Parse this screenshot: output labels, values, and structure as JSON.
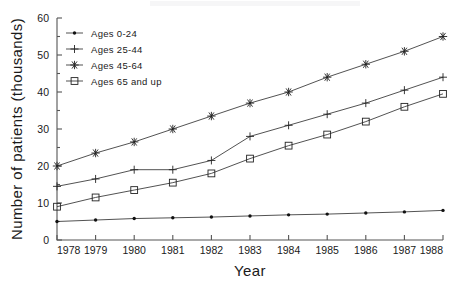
{
  "chart_data": {
    "type": "line",
    "title": "",
    "xlabel": "Year",
    "ylabel": "Number of patients (thousands)",
    "x": [
      1978,
      1979,
      1980,
      1981,
      1982,
      1983,
      1984,
      1985,
      1986,
      1987,
      1988
    ],
    "categories": [
      "1978",
      "1979",
      "1980",
      "1981",
      "1982",
      "1983",
      "1984",
      "1985",
      "1986",
      "1987",
      "1988"
    ],
    "xlim": [
      1978,
      1988
    ],
    "ylim": [
      0,
      60
    ],
    "yticks": [
      0,
      10,
      20,
      30,
      40,
      50,
      60
    ],
    "ytick_labels": [
      "0",
      "10",
      "20",
      "30",
      "40",
      "50",
      "60"
    ],
    "grid": false,
    "legend_position": "upper left inside",
    "series": [
      {
        "name": "Ages 0-24",
        "marker": "filled-dot",
        "values": [
          5.0,
          5.4,
          5.8,
          6.0,
          6.2,
          6.5,
          6.8,
          7.0,
          7.3,
          7.6,
          8.0
        ]
      },
      {
        "name": "Ages 25-44",
        "marker": "plus",
        "values": [
          14.5,
          16.5,
          19.0,
          19.0,
          21.5,
          28.0,
          31.0,
          34.0,
          37.0,
          40.5,
          44.0
        ]
      },
      {
        "name": "Ages 45-64",
        "marker": "asterisk",
        "values": [
          20.0,
          23.5,
          26.5,
          30.0,
          33.5,
          37.0,
          40.0,
          44.0,
          47.5,
          51.0,
          55.0
        ]
      },
      {
        "name": "Ages 65 and up",
        "marker": "open-square",
        "values": [
          9.0,
          11.5,
          13.5,
          15.5,
          18.0,
          22.0,
          25.5,
          28.5,
          32.0,
          36.0,
          39.5
        ]
      }
    ]
  },
  "legend": {
    "entries": [
      {
        "label": "Ages 0-24"
      },
      {
        "label": "Ages 25-44"
      },
      {
        "label": "Ages 45-64"
      },
      {
        "label": "Ages 65 and up"
      }
    ]
  },
  "colors": {
    "line": "#333333",
    "axis": "#555555",
    "text": "#1a1a1a",
    "background": "#ffffff"
  }
}
